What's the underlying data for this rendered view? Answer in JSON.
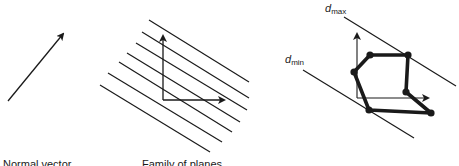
{
  "panels": [
    {
      "id": "normal-vector",
      "caption": "Normal vector",
      "arrow": {
        "from": [
          8,
          101
        ],
        "to": [
          63,
          34
        ]
      }
    },
    {
      "id": "family-of-planes",
      "caption": "Family of planes",
      "axes": {
        "origin": [
          163,
          100
        ],
        "y_top": [
          163,
          36
        ],
        "x_right": [
          224,
          100
        ]
      },
      "lines": [
        [
          [
            149,
            20
          ],
          [
            249,
            82
          ]
        ],
        [
          [
            142,
            32
          ],
          [
            249,
            98
          ]
        ],
        [
          [
            136,
            43
          ],
          [
            247,
            110
          ]
        ],
        [
          [
            127,
            53
          ],
          [
            240,
            122
          ]
        ],
        [
          [
            119,
            62
          ],
          [
            232,
            132
          ]
        ],
        [
          [
            108,
            73
          ],
          [
            222,
            142
          ]
        ],
        [
          [
            100,
            85
          ],
          [
            210,
            152
          ]
        ]
      ]
    },
    {
      "id": "polygon-extents",
      "labels": {
        "dmax": {
          "base": "d",
          "sub": "max"
        },
        "dmin": {
          "base": "d",
          "sub": "min"
        }
      },
      "axes": {
        "origin": [
          357,
          98
        ],
        "y_top": [
          357,
          34
        ],
        "x_right": [
          428,
          98
        ]
      },
      "dmax_line": [
        [
          344,
          17
        ],
        [
          456,
          86
        ]
      ],
      "dmin_line": [
        [
          303,
          70
        ],
        [
          414,
          138
        ]
      ],
      "polygon": [
        [
          370,
          55
        ],
        [
          408,
          55
        ],
        [
          406,
          92
        ],
        [
          431,
          113
        ],
        [
          369,
          110
        ],
        [
          354,
          72
        ]
      ]
    }
  ],
  "colors": {
    "ink": "#1a1a1a",
    "background": "#ffffff"
  }
}
